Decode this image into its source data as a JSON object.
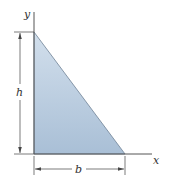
{
  "figure": {
    "type": "right-triangle-area",
    "axes": {
      "x_label": "x",
      "y_label": "y"
    },
    "dimensions": {
      "height_label": "h",
      "base_label": "b"
    },
    "colors": {
      "fill_top": "#d2dfec",
      "fill_bottom": "#a9bfd6",
      "edge": "#6f8196",
      "axis": "#555555",
      "dim_line": "#444444"
    }
  }
}
